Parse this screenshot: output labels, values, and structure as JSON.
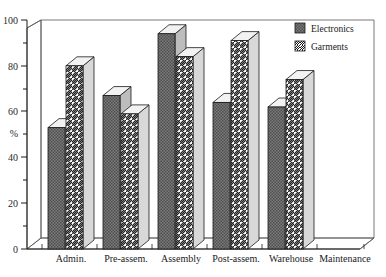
{
  "chart_data": {
    "type": "bar",
    "title": "",
    "subtitle": "",
    "xlabel": "",
    "ylabel": "%",
    "ylim": [
      0,
      100
    ],
    "yticks": [
      0,
      20,
      40,
      60,
      80,
      100
    ],
    "ytick_labels": [
      "0",
      "20",
      "40",
      "60",
      "80",
      "100"
    ],
    "minor_ticks": true,
    "grid": false,
    "legend_position": "top-right",
    "style": "3d-bars",
    "categories": [
      "Admin.",
      "Pre-assem.",
      "Assembly",
      "Post-assem.",
      "Warehouse",
      "Maintenance"
    ],
    "series": [
      {
        "name": "Electronics",
        "fill": "stipple-dark",
        "color": "#6e6e6e",
        "values": [
          53,
          67,
          94,
          64,
          62,
          0
        ]
      },
      {
        "name": "Garments",
        "fill": "diagonal-hatch",
        "color": "#ffffff",
        "values": [
          80,
          59,
          84,
          91,
          74,
          0
        ]
      }
    ]
  },
  "legend": {
    "entries": [
      {
        "label": "Electronics"
      },
      {
        "label": "Garments"
      }
    ]
  },
  "axis": {
    "y_label": "%",
    "y_tick_100": "100",
    "y_tick_80": "80",
    "y_tick_60": "60",
    "y_tick_40": "40",
    "y_tick_20": "20",
    "y_tick_0": "0"
  },
  "categories_text": {
    "c0": "Admin.",
    "c1": "Pre-assem.",
    "c2": "Assembly",
    "c3": "Post-assem.",
    "c4": "Warehouse",
    "c5": "Maintenance"
  },
  "colors": {
    "electronics_fill": "#6e6e6e",
    "garments_fill": "#ffffff",
    "outline": "#1a1a1a",
    "side_face": "#c9c9c9",
    "top_face": "#efefef",
    "frame": "#555555",
    "background": "#ffffff"
  }
}
